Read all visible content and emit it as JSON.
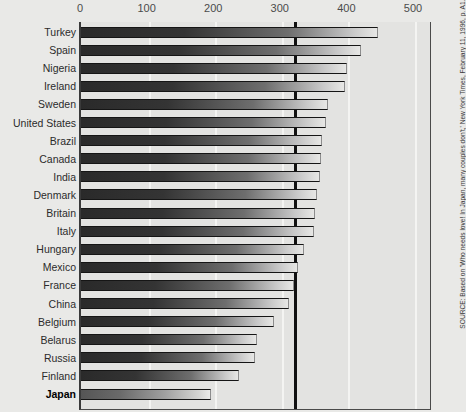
{
  "chart_data": {
    "type": "bar",
    "orientation": "horizontal",
    "title": "",
    "xlabel": "",
    "ylabel": "",
    "xlim": [
      0,
      530
    ],
    "xticks": [
      "0",
      "100",
      "200",
      "300",
      "400",
      "500"
    ],
    "xtick_values": [
      0,
      100,
      200,
      300,
      400,
      500
    ],
    "grid": true,
    "gridlines_at": [
      100,
      200,
      300,
      400,
      500
    ],
    "reference_line": {
      "value": 318,
      "style": "thick-black-vertical"
    },
    "legend": null,
    "categories": [
      "Turkey",
      "Spain",
      "Nigeria",
      "Ireland",
      "Sweden",
      "United States",
      "Brazil",
      "Canada",
      "India",
      "Denmark",
      "Britain",
      "Italy",
      "Hungary",
      "Mexico",
      "France",
      "China",
      "Belgium",
      "Belarus",
      "Russia",
      "Finland",
      "Japan"
    ],
    "values": [
      446,
      420,
      400,
      396,
      371,
      368,
      362,
      360,
      359,
      355,
      352,
      350,
      335,
      326,
      320,
      312,
      290,
      265,
      261,
      237,
      195
    ],
    "highlighted_category": "Japan",
    "series": [
      {
        "name": "",
        "values": [
          446,
          420,
          400,
          396,
          371,
          368,
          362,
          360,
          359,
          355,
          352,
          350,
          335,
          326,
          320,
          312,
          290,
          265,
          261,
          237,
          195
        ]
      }
    ]
  },
  "axis": {
    "ticks": [
      {
        "label": "0",
        "value": 0
      },
      {
        "label": "100",
        "value": 100
      },
      {
        "label": "200",
        "value": 200
      },
      {
        "label": "300",
        "value": 300
      },
      {
        "label": "400",
        "value": 400
      },
      {
        "label": "500",
        "value": 500
      }
    ]
  },
  "rows": [
    {
      "label": "Turkey",
      "value": 446,
      "bold": false
    },
    {
      "label": "Spain",
      "value": 420,
      "bold": false
    },
    {
      "label": "Nigeria",
      "value": 400,
      "bold": false
    },
    {
      "label": "Ireland",
      "value": 396,
      "bold": false
    },
    {
      "label": "Sweden",
      "value": 371,
      "bold": false
    },
    {
      "label": "United States",
      "value": 368,
      "bold": false
    },
    {
      "label": "Brazil",
      "value": 362,
      "bold": false
    },
    {
      "label": "Canada",
      "value": 360,
      "bold": false
    },
    {
      "label": "India",
      "value": 359,
      "bold": false
    },
    {
      "label": "Denmark",
      "value": 355,
      "bold": false
    },
    {
      "label": "Britain",
      "value": 352,
      "bold": false
    },
    {
      "label": "Italy",
      "value": 350,
      "bold": false
    },
    {
      "label": "Hungary",
      "value": 335,
      "bold": false
    },
    {
      "label": "Mexico",
      "value": 326,
      "bold": false
    },
    {
      "label": "France",
      "value": 320,
      "bold": false
    },
    {
      "label": "China",
      "value": 312,
      "bold": false
    },
    {
      "label": "Belgium",
      "value": 290,
      "bold": false
    },
    {
      "label": "Belarus",
      "value": 265,
      "bold": false
    },
    {
      "label": "Russia",
      "value": 261,
      "bold": false
    },
    {
      "label": "Finland",
      "value": 237,
      "bold": false
    },
    {
      "label": "Japan",
      "value": 195,
      "bold": true
    }
  ],
  "source": {
    "text": "SOURCE: Based on 'Who needs love! In Japan, many couples don't,' New York Times, February 11, 1996, p. A1."
  },
  "colors": {
    "background": "#e9e9e7",
    "plot_background": "#e3e3e1",
    "bar_dark": "#2a2a2a",
    "bar_light": "#e7e7e5",
    "reference_line": "#111111",
    "gridline": "#f4f4f2",
    "text": "#2b2b2b"
  }
}
